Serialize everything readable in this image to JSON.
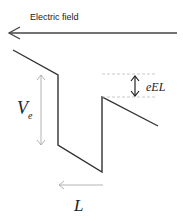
{
  "labels": {
    "field": "Electric field",
    "ve_main": "V",
    "ve_sub": "e",
    "eel": "eEL",
    "l": "L"
  },
  "colors": {
    "line": "#333333",
    "guide": "#aaaaaa",
    "dashed": "#bbbbbb"
  }
}
